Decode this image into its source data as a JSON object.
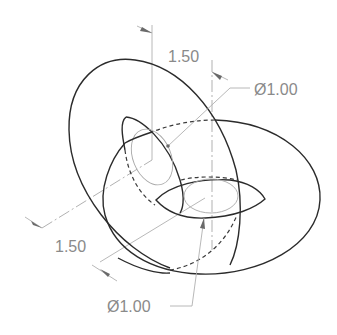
{
  "drawing": {
    "type": "engineering isometric drawing",
    "subject": "two interlocking tori",
    "colors": {
      "visible_edge": "#2b2b2b",
      "dimension": "#8a8a8a",
      "construction": "#a8a8a8",
      "background": "#ffffff"
    },
    "dimensions": [
      {
        "id": "top-distance",
        "kind": "linear",
        "label": "1.50"
      },
      {
        "id": "top-diameter",
        "kind": "diameter",
        "label": "Ø1.00"
      },
      {
        "id": "left-distance",
        "kind": "linear",
        "label": "1.50"
      },
      {
        "id": "bottom-diameter",
        "kind": "diameter",
        "label": "Ø1.00"
      }
    ]
  }
}
